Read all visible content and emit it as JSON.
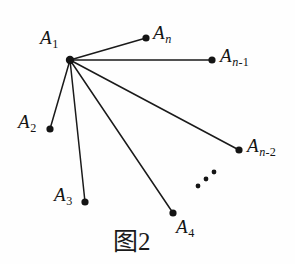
{
  "figure": {
    "caption": "图2",
    "background_color": "#fefefe",
    "ink_color": "#141414",
    "width": 295,
    "height": 264
  },
  "chart_data": {
    "type": "diagram",
    "diagram_kind": "star-graph",
    "title": "图2",
    "center_vertex": "A1",
    "edge_count": 6,
    "nodes": [
      {
        "id": "A1",
        "label_main": "A",
        "label_sub": "1",
        "sub_style": "roman",
        "x": 70,
        "y": 60,
        "label_x": 40,
        "label_y": 28,
        "is_center": true
      },
      {
        "id": "An",
        "label_main": "A",
        "label_sub": "n",
        "sub_style": "italic",
        "x": 146,
        "y": 38,
        "label_x": 153,
        "label_y": 23,
        "is_center": false
      },
      {
        "id": "An-1",
        "label_main": "A",
        "label_sub": "n-1",
        "sub_style": "mixed",
        "x": 212,
        "y": 60,
        "label_x": 220,
        "label_y": 46,
        "is_center": false
      },
      {
        "id": "An-2",
        "label_main": "A",
        "label_sub": "n-2",
        "sub_style": "mixed",
        "x": 239,
        "y": 150,
        "label_x": 247,
        "label_y": 136,
        "is_center": false
      },
      {
        "id": "A2",
        "label_main": "A",
        "label_sub": "2",
        "sub_style": "roman",
        "x": 50,
        "y": 129,
        "label_x": 18,
        "label_y": 112,
        "is_center": false
      },
      {
        "id": "A3",
        "label_main": "A",
        "label_sub": "3",
        "sub_style": "roman",
        "x": 85,
        "y": 202,
        "label_x": 54,
        "label_y": 185,
        "is_center": false
      },
      {
        "id": "A4",
        "label_main": "A",
        "label_sub": "4",
        "sub_style": "roman",
        "x": 173,
        "y": 213,
        "label_x": 176,
        "label_y": 217,
        "is_center": false
      }
    ],
    "edges": [
      {
        "from": "A1",
        "to": "An",
        "x1": 70,
        "y1": 60,
        "x2": 146,
        "y2": 38
      },
      {
        "from": "A1",
        "to": "An-1",
        "x1": 70,
        "y1": 60,
        "x2": 212,
        "y2": 60
      },
      {
        "from": "A1",
        "to": "An-2",
        "x1": 70,
        "y1": 60,
        "x2": 239,
        "y2": 150
      },
      {
        "from": "A1",
        "to": "A2",
        "x1": 70,
        "y1": 60,
        "x2": 50,
        "y2": 129
      },
      {
        "from": "A1",
        "to": "A3",
        "x1": 70,
        "y1": 60,
        "x2": 85,
        "y2": 202
      },
      {
        "from": "A1",
        "to": "A4",
        "x1": 70,
        "y1": 60,
        "x2": 173,
        "y2": 213
      }
    ],
    "ellipsis_dots": [
      {
        "x": 198,
        "y": 186
      },
      {
        "x": 206,
        "y": 179
      },
      {
        "x": 214,
        "y": 172
      }
    ]
  }
}
